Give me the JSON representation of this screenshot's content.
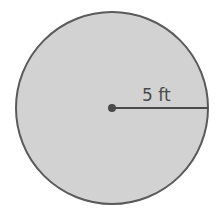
{
  "figure": {
    "shape": "circle",
    "radius_label": "5 ft",
    "colors": {
      "fill": "#d2d2d2",
      "stroke": "#5a5a5a",
      "text": "#4a4a4a",
      "background": "#ffffff"
    }
  }
}
